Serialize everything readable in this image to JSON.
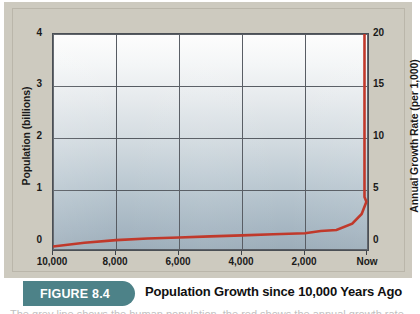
{
  "figure": {
    "badge_label": "FIGURE 8.4",
    "caption": "Population Growth since 10,000 Years Ago",
    "body_sliver": "The grey line shows the human population, the red shows the annual growth rate."
  },
  "colors": {
    "plate": "#cdcabf",
    "badge": "#4d8288",
    "series_line": "#c0392b",
    "grid": "#555a61",
    "axis": "#4a4f55"
  },
  "chart_data": {
    "type": "line",
    "title": "Population Growth since 10,000 Years Ago",
    "xlabel": "",
    "ylabel": "Population (billions)",
    "y2label": "Annual Growth Rate (per 1,000)",
    "x_tick_labels": [
      "10,000",
      "8,000",
      "6,000",
      "4,000",
      "2,000",
      "Now"
    ],
    "x_tick_values": [
      10000,
      8000,
      6000,
      4000,
      2000,
      0
    ],
    "xlim": [
      10000,
      0
    ],
    "y_tick_labels": [
      "0",
      "1",
      "2",
      "3",
      "4"
    ],
    "y_tick_values": [
      0,
      1,
      2,
      3,
      4
    ],
    "ylim": [
      0,
      4
    ],
    "y2_tick_labels": [
      "0",
      "5",
      "10",
      "15",
      "20"
    ],
    "y2_tick_values": [
      0,
      5,
      10,
      15,
      20
    ],
    "y2lim": [
      0,
      20
    ],
    "grid": true,
    "legend": "none",
    "series": [
      {
        "name": "World Population",
        "unit": "billions",
        "color": "#c0392b",
        "x": [
          10000,
          9000,
          8000,
          7000,
          6000,
          5000,
          4000,
          3000,
          2000,
          1500,
          1000,
          500,
          200,
          50,
          0,
          0
        ],
        "values": [
          0.02,
          0.09,
          0.14,
          0.17,
          0.19,
          0.21,
          0.23,
          0.25,
          0.27,
          0.31,
          0.33,
          0.45,
          0.63,
          0.86,
          0.95,
          4.0
        ]
      }
    ],
    "annotations": [
      "Curve is nearly flat from 10,000 years ago until about 2,000 years ago, then rises steeply and spikes vertically at Now."
    ]
  }
}
